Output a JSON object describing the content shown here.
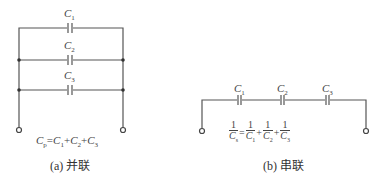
{
  "parallel": {
    "labels": [
      {
        "base": "C",
        "sub": "1"
      },
      {
        "base": "C",
        "sub": "2"
      },
      {
        "base": "C",
        "sub": "3"
      }
    ],
    "formula": {
      "lhs_base": "C",
      "lhs_sub": "p",
      "eq": "=",
      "terms": [
        {
          "base": "C",
          "sub": "1"
        },
        {
          "base": "C",
          "sub": "2"
        },
        {
          "base": "C",
          "sub": "3"
        }
      ],
      "op": "+"
    },
    "caption": "(a) 并联"
  },
  "series": {
    "labels": [
      {
        "base": "C",
        "sub": "1"
      },
      {
        "base": "C",
        "sub": "2"
      },
      {
        "base": "C",
        "sub": "3"
      }
    ],
    "formula": {
      "num": "1",
      "lhs_sub": "s",
      "eq": "=",
      "op": "+",
      "den_base": "C",
      "subs": [
        "1",
        "2",
        "3"
      ]
    },
    "caption": "(b) 串联"
  }
}
